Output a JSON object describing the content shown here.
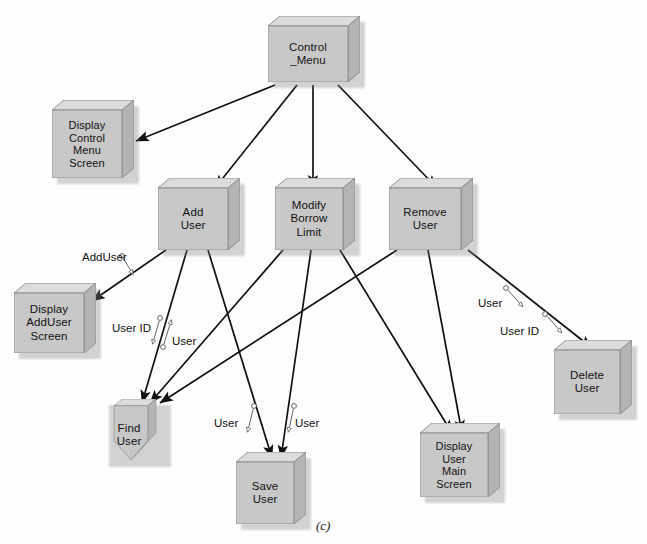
{
  "diagram": {
    "caption": "(c)",
    "colors": {
      "node_face": "#c8c8c8",
      "node_top": "#dcdcdc",
      "node_side": "#b4b4b4",
      "node_border": "#8a8a8a",
      "edge": "#111111",
      "annotation": "#555555",
      "background": "#fefefe"
    },
    "nodes": [
      {
        "id": "control_menu",
        "label": "Control\n_Menu",
        "x": 268,
        "y": 16,
        "w": 92,
        "h": 66,
        "shape": "box"
      },
      {
        "id": "display_control",
        "label": "Display\nControl\nMenu\nScreen",
        "x": 52,
        "y": 100,
        "w": 82,
        "h": 78,
        "shape": "box"
      },
      {
        "id": "add_user",
        "label": "Add\nUser",
        "x": 158,
        "y": 178,
        "w": 82,
        "h": 72,
        "shape": "box"
      },
      {
        "id": "modify_borrow_limit",
        "label": "Modify\nBorrow\nLimit",
        "x": 275,
        "y": 178,
        "w": 80,
        "h": 72,
        "shape": "box"
      },
      {
        "id": "remove_user",
        "label": "Remove\nUser",
        "x": 389,
        "y": 178,
        "w": 84,
        "h": 72,
        "shape": "box"
      },
      {
        "id": "display_adduser",
        "label": "Display\nAddUser\nScreen",
        "x": 14,
        "y": 283,
        "w": 82,
        "h": 70,
        "shape": "box"
      },
      {
        "id": "find_user",
        "label": "Find\nUser",
        "x": 104,
        "y": 399,
        "w": 62,
        "h": 62,
        "shape": "pentagon"
      },
      {
        "id": "save_user",
        "label": "Save\nUser",
        "x": 236,
        "y": 452,
        "w": 70,
        "h": 72,
        "shape": "box"
      },
      {
        "id": "display_user_main",
        "label": "Display\nUser\nMain\nScreen",
        "x": 420,
        "y": 423,
        "w": 80,
        "h": 74,
        "shape": "box"
      },
      {
        "id": "delete_user",
        "label": "Delete\nUser",
        "x": 554,
        "y": 340,
        "w": 78,
        "h": 74,
        "shape": "box"
      }
    ],
    "edges": [
      {
        "from": "control_menu",
        "to": "display_control",
        "x1": 275,
        "y1": 85,
        "x2": 136,
        "y2": 141
      },
      {
        "from": "control_menu",
        "to": "add_user",
        "x1": 297,
        "y1": 85,
        "x2": 215,
        "y2": 188
      },
      {
        "from": "control_menu",
        "to": "modify_borrow_limit",
        "x1": 313,
        "y1": 85,
        "x2": 313,
        "y2": 188
      },
      {
        "from": "control_menu",
        "to": "remove_user",
        "x1": 338,
        "y1": 85,
        "x2": 437,
        "y2": 188
      },
      {
        "from": "add_user",
        "to": "display_adduser",
        "x1": 166,
        "y1": 250,
        "x2": 92,
        "y2": 301
      },
      {
        "from": "add_user",
        "to": "find_user",
        "x1": 187,
        "y1": 250,
        "x2": 142,
        "y2": 403
      },
      {
        "from": "add_user",
        "to": "save_user",
        "x1": 208,
        "y1": 250,
        "x2": 272,
        "y2": 458
      },
      {
        "from": "modify_borrow_limit",
        "to": "find_user",
        "x1": 283,
        "y1": 250,
        "x2": 150,
        "y2": 403
      },
      {
        "from": "modify_borrow_limit",
        "to": "save_user",
        "x1": 311,
        "y1": 250,
        "x2": 281,
        "y2": 458
      },
      {
        "from": "modify_borrow_limit",
        "to": "display_user_main",
        "x1": 340,
        "y1": 250,
        "x2": 452,
        "y2": 433
      },
      {
        "from": "remove_user",
        "to": "find_user",
        "x1": 397,
        "y1": 250,
        "x2": 160,
        "y2": 403
      },
      {
        "from": "remove_user",
        "to": "display_user_main",
        "x1": 428,
        "y1": 250,
        "x2": 462,
        "y2": 433
      },
      {
        "from": "remove_user",
        "to": "delete_user",
        "x1": 468,
        "y1": 250,
        "x2": 592,
        "y2": 348
      }
    ],
    "flow_labels": [
      {
        "id": "adduser_out",
        "text": "AddUser",
        "x": 82,
        "y": 251,
        "gx": 122,
        "gy": 256,
        "gx2": 134,
        "gy2": 276,
        "head": "end"
      },
      {
        "id": "userid_find",
        "text": "User ID",
        "x": 112,
        "y": 322,
        "gx": 160,
        "gy": 318,
        "gx2": 152,
        "gy2": 346,
        "head": "end"
      },
      {
        "id": "user_find",
        "text": "User",
        "x": 172,
        "y": 335,
        "gx": 172,
        "gy": 318,
        "gx2": 163,
        "gy2": 347,
        "head": "start"
      },
      {
        "id": "user_save_left",
        "text": "User",
        "x": 214,
        "y": 417,
        "gx": 254,
        "gy": 406,
        "gx2": 247,
        "gy2": 434,
        "head": "end"
      },
      {
        "id": "user_save_right",
        "text": "User",
        "x": 295,
        "y": 417,
        "gx": 294,
        "gy": 406,
        "gx2": 288,
        "gy2": 434,
        "head": "end"
      },
      {
        "id": "user_delete",
        "text": "User",
        "x": 478,
        "y": 297,
        "gx": 506,
        "gy": 288,
        "gx2": 524,
        "gy2": 308,
        "head": "end"
      },
      {
        "id": "userid_delete",
        "text": "User ID",
        "x": 500,
        "y": 325,
        "gx": 545,
        "gy": 314,
        "gx2": 563,
        "gy2": 334,
        "head": "end"
      }
    ]
  }
}
